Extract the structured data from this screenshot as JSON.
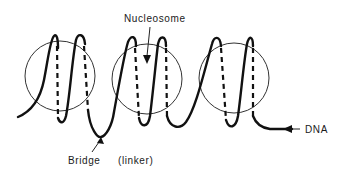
{
  "diagram": {
    "labels": {
      "nucleosome": "Nucleosome",
      "bridge": "Bridge",
      "linker": "(linker)",
      "dna": "DNA"
    },
    "nucleosome_count": 3,
    "dna_turns_per_nucleosome": 2,
    "colors": {
      "ink": "#111111",
      "background": "#ffffff"
    }
  }
}
